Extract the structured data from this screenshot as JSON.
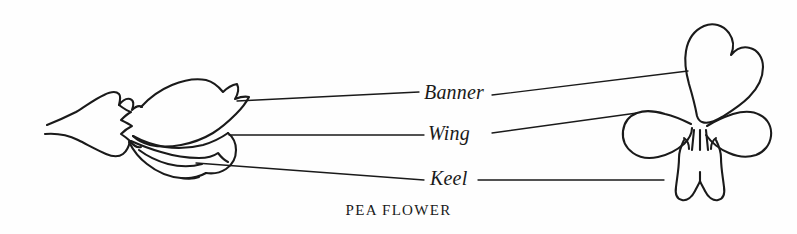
{
  "figure": {
    "caption": "PEA FLOWER",
    "background_color": "#fefefe",
    "ink_color": "#1a1a1a",
    "labels": [
      {
        "id": "banner",
        "text": "Banner"
      },
      {
        "id": "wing",
        "text": "Wing"
      },
      {
        "id": "keel",
        "text": "Keel"
      }
    ],
    "parts": {
      "side_view_name": "pea-flower-side-view",
      "front_view_name": "pea-flower-front-view"
    },
    "leader_lines": [
      {
        "id": "banner-left",
        "from": "side-view-banner-petal",
        "to": "banner-label"
      },
      {
        "id": "banner-right",
        "from": "banner-label",
        "to": "front-view-banner-petal"
      },
      {
        "id": "wing-left",
        "from": "side-view-wing-petal",
        "to": "wing-label"
      },
      {
        "id": "wing-right",
        "from": "wing-label",
        "to": "front-view-wing-petal"
      },
      {
        "id": "keel-left",
        "from": "side-view-keel-petal",
        "to": "keel-label"
      },
      {
        "id": "keel-right",
        "from": "keel-label",
        "to": "front-view-keel-petal"
      }
    ]
  }
}
